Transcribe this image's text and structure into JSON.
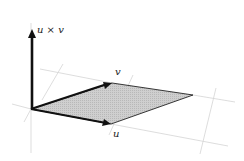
{
  "diagram": {
    "labels": {
      "cross": "u × v",
      "u": "u",
      "v": "v"
    },
    "colors": {
      "parallelogram_fill": "#c8c8c8",
      "vector": "#111111",
      "grid": "#d4d4d4",
      "background": "#ffffff"
    },
    "points": {
      "origin": [
        31,
        109
      ],
      "u_tip": [
        111,
        124
      ],
      "v_tip": [
        112,
        83
      ],
      "far_corner": [
        193,
        95
      ],
      "cross_tip": [
        32,
        30
      ]
    }
  }
}
